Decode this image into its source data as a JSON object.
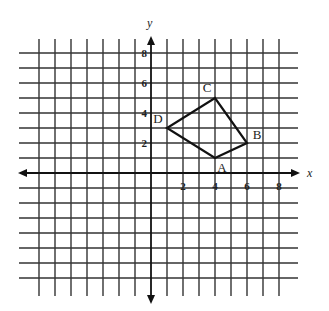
{
  "diagram": {
    "type": "coordinate-grid",
    "axes": {
      "x_label": "x",
      "y_label": "y",
      "x_range": [
        -7,
        8
      ],
      "y_range": [
        -7,
        8
      ],
      "x_ticks": [
        {
          "value": 2,
          "label": "2"
        },
        {
          "value": 4,
          "label": "4"
        },
        {
          "value": 6,
          "label": "6"
        },
        {
          "value": 8,
          "label": "8"
        }
      ],
      "y_ticks": [
        {
          "value": 2,
          "label": "2"
        },
        {
          "value": 4,
          "label": "4"
        },
        {
          "value": 6,
          "label": "6"
        },
        {
          "value": 8,
          "label": "8"
        }
      ]
    },
    "polygon": {
      "name": "ABCD",
      "vertices": [
        {
          "label": "A",
          "x": 4,
          "y": 1
        },
        {
          "label": "B",
          "x": 6,
          "y": 2
        },
        {
          "label": "C",
          "x": 4,
          "y": 5
        },
        {
          "label": "D",
          "x": 1,
          "y": 3
        }
      ]
    },
    "colors": {
      "grid": "#333333",
      "axis": "#111111",
      "polygon": "#111111",
      "background": "#ffffff"
    }
  }
}
